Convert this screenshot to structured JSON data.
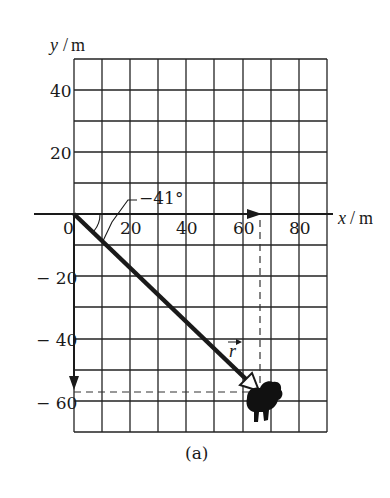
{
  "figure": {
    "caption": "(a)",
    "x_axis": {
      "var": "x",
      "unit": "m",
      "ticks": [
        "0",
        "20",
        "40",
        "60",
        "80"
      ]
    },
    "y_axis": {
      "var": "y",
      "unit": "m",
      "ticks": [
        "40",
        "20",
        "0",
        "− 20",
        "− 40",
        "− 60"
      ]
    },
    "angle_label": "−41°",
    "vector_label": "r",
    "vector": {
      "from": [
        0,
        0
      ],
      "to": [
        65,
        -57
      ],
      "angle_deg": -41
    },
    "grid": {
      "x_range": [
        0,
        90
      ],
      "y_range": [
        -70,
        50
      ],
      "spacing": 10
    },
    "colors": {
      "ink": "#1a1a1a",
      "background": "#ffffff"
    }
  }
}
